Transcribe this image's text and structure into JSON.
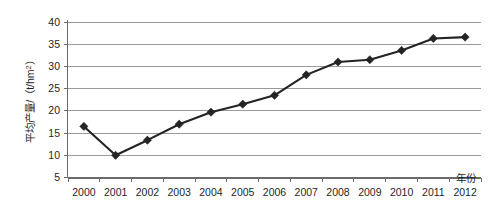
{
  "chart_data": {
    "type": "line",
    "title": "",
    "xlabel": "年份",
    "ylabel": "平均产量/（t/hm²）",
    "categories": [
      "2000",
      "2001",
      "2002",
      "2003",
      "2004",
      "2005",
      "2006",
      "2007",
      "2008",
      "2009",
      "2010",
      "2011",
      "2012"
    ],
    "values": [
      16.5,
      10.0,
      13.4,
      17.0,
      19.7,
      21.5,
      23.5,
      28.1,
      31.0,
      31.5,
      33.6,
      36.3,
      36.6
    ],
    "series": [
      {
        "name": "平均产量",
        "values": [
          16.5,
          10.0,
          13.4,
          17.0,
          19.7,
          21.5,
          23.5,
          28.1,
          31.0,
          31.5,
          33.6,
          36.3,
          36.6
        ]
      }
    ],
    "x": [
      2000,
      2001,
      2002,
      2003,
      2004,
      2005,
      2006,
      2007,
      2008,
      2009,
      2010,
      2011,
      2012
    ],
    "ylim": [
      5,
      40
    ],
    "yticks": [
      5,
      10,
      15,
      20,
      25,
      30,
      35,
      40
    ],
    "ytick_labels": [
      "5",
      "10",
      "15",
      "20",
      "25",
      "30",
      "35",
      "40"
    ],
    "xtick_labels": [
      "2000",
      "2001",
      "2002",
      "2003",
      "2004",
      "2005",
      "2006",
      "2007",
      "2008",
      "2009",
      "2010",
      "2011",
      "2012"
    ],
    "grid": "horizontal",
    "legend": "none",
    "marker": "diamond",
    "line_color": "#242424",
    "grid_color": "#9a9a9a",
    "axis_color": "#6b6b6b",
    "background_color": "#ffffff"
  },
  "axis_titles": {
    "y": "平均产量/（t/hm²）",
    "y_main": "平均产量/（t/hm",
    "y_sup": "2",
    "y_tail": "）",
    "x": "年份"
  }
}
